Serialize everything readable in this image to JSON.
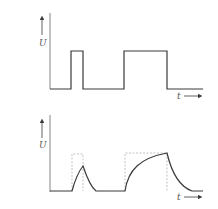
{
  "diagrams": [
    {
      "name": "input-pulses",
      "y_label": "U",
      "x_label": "t",
      "description": "Rectangular voltage pulses: a short pulse and a long pulse"
    },
    {
      "name": "rc-response",
      "y_label": "U",
      "x_label": "t",
      "description": "RC charging/discharging response; dashed outlines show the original rectangular pulses"
    }
  ],
  "colors": {
    "line": "#3a3a3a",
    "dashed": "#9a9a9a",
    "label": "#555555"
  }
}
